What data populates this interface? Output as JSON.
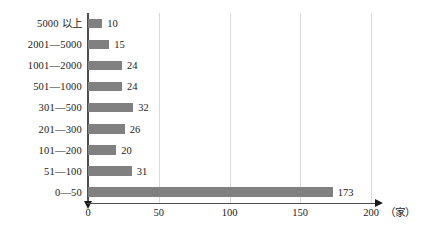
{
  "chart_data": {
    "type": "bar",
    "orientation": "horizontal",
    "title": "",
    "xlabel": "（家）",
    "ylabel": "",
    "xlim": [
      0,
      200
    ],
    "xticks": [
      0,
      50,
      100,
      150,
      200
    ],
    "grid": "vertical",
    "legend": "none",
    "bar_color": "#808080",
    "gridline_color": "#d9d9d9",
    "axis_color": "#4d4d4d",
    "categories": [
      "5000 以上",
      "2001—5000",
      "1001—2000",
      "501—1000",
      "301—500",
      "201—300",
      "101—200",
      "51—100",
      "0—50"
    ],
    "values": [
      10,
      15,
      24,
      24,
      32,
      26,
      20,
      31,
      173
    ]
  },
  "caption": {
    "text": ""
  }
}
